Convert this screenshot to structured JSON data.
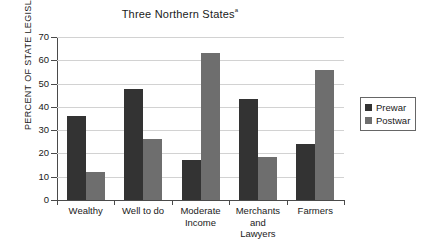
{
  "chart_data": {
    "type": "bar",
    "title": "Three Northern States",
    "title_superscript": "a",
    "xlabel": "",
    "ylabel": "PERCENT OF STATE LEGISLATORS",
    "ylim": [
      0,
      70
    ],
    "ytick_step": 10,
    "yticks": [
      70,
      60,
      50,
      40,
      30,
      20,
      10,
      0
    ],
    "grid": true,
    "legend_position": "right",
    "categories": [
      "Wealthy",
      "Well to do",
      "Moderate Income",
      "Merchants and Lawyers",
      "Farmers"
    ],
    "category_lines": [
      [
        "Wealthy"
      ],
      [
        "Well to do"
      ],
      [
        "Moderate",
        "Income"
      ],
      [
        "Merchants",
        "and",
        "Lawyers"
      ],
      [
        "Farmers"
      ]
    ],
    "series": [
      {
        "name": "Prewar",
        "color": "#333333",
        "values": [
          36,
          47.5,
          17,
          43.5,
          24
        ]
      },
      {
        "name": "Postwar",
        "color": "#6e6e6e",
        "values": [
          12,
          26,
          63,
          18.5,
          56
        ]
      }
    ]
  },
  "legend": {
    "items": [
      {
        "label": "Prewar"
      },
      {
        "label": "Postwar"
      }
    ]
  }
}
